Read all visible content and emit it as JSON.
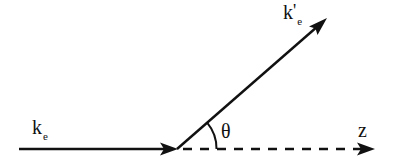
{
  "diagram": {
    "title": "",
    "stroke_color": "#111111",
    "background": "#ffffff",
    "vectors": [
      {
        "id": "incident",
        "label_main": "k",
        "label_sub": "e",
        "label_prime": "",
        "style": "solid",
        "from": [
          19,
          149
        ],
        "to": [
          177,
          149
        ]
      },
      {
        "id": "scattered",
        "label_main": "k",
        "label_sub": "e",
        "label_prime": "'",
        "style": "solid",
        "from": [
          177,
          149
        ],
        "to": [
          326,
          19
        ]
      },
      {
        "id": "z-axis",
        "label_main": "z",
        "label_sub": "",
        "label_prime": "",
        "style": "dashed",
        "from": [
          177,
          149
        ],
        "to": [
          374,
          149
        ]
      }
    ],
    "angle": {
      "symbol": "θ",
      "between": [
        "z-axis",
        "scattered"
      ],
      "arc_radius": 40
    },
    "labels": {
      "incident": {
        "main": "k",
        "sub": "e"
      },
      "scattered": {
        "main": "k",
        "prime": "'",
        "sub": "e"
      },
      "axis": {
        "main": "z"
      },
      "angle": "θ"
    }
  }
}
